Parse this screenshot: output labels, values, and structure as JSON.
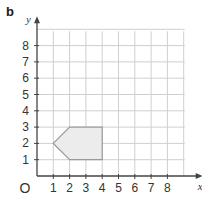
{
  "panel_label": "b",
  "chart_data": {
    "type": "scatter",
    "title": "",
    "xlabel": "x",
    "ylabel": "y",
    "origin_label": "O",
    "xlim": [
      0,
      9
    ],
    "ylim": [
      0,
      9
    ],
    "grid": true,
    "x_ticks": [
      "1",
      "2",
      "3",
      "4",
      "5",
      "6",
      "7",
      "8"
    ],
    "y_ticks": [
      "1",
      "2",
      "3",
      "4",
      "5",
      "6",
      "7",
      "8"
    ],
    "shapes": [
      {
        "name": "pentagon",
        "fill": "#ececec",
        "stroke": "#999999",
        "vertices": [
          [
            1,
            2
          ],
          [
            2,
            3
          ],
          [
            4,
            3
          ],
          [
            4,
            1
          ],
          [
            2,
            1
          ]
        ]
      }
    ]
  },
  "colors": {
    "grid": "#cfcfcf",
    "axis": "#444444",
    "text": "#333333"
  }
}
